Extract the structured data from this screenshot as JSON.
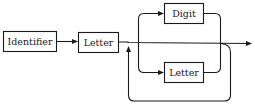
{
  "diagram": {
    "type": "syntax-diagram",
    "nodes": [
      {
        "id": "identifier",
        "label": "Identifier"
      },
      {
        "id": "letter_first",
        "label": "Letter"
      },
      {
        "id": "digit",
        "label": "Digit"
      },
      {
        "id": "letter_loop",
        "label": "Letter"
      }
    ],
    "edges": [
      {
        "from": "identifier",
        "to": "letter_first"
      },
      {
        "from": "letter_first",
        "to": "exit"
      },
      {
        "from": "branch",
        "to": "digit"
      },
      {
        "from": "branch",
        "to": "letter_loop"
      },
      {
        "from": "digit",
        "to": "merge"
      },
      {
        "from": "letter_loop",
        "to": "merge"
      },
      {
        "from": "merge",
        "to": "branch",
        "label": "loop-back"
      }
    ],
    "colors": {
      "stroke": "#1a1a1a",
      "background": "#ffffff"
    }
  }
}
